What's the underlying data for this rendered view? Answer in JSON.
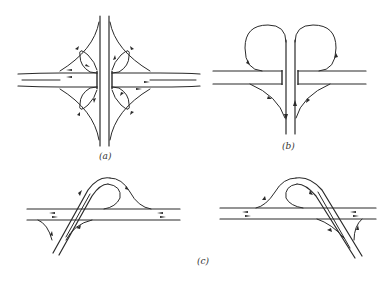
{
  "figure": {
    "panels": [
      {
        "id": "a",
        "label": "(a)",
        "description": "Full cloverleaf interchange with four loop ramps and four outer connector ramps"
      },
      {
        "id": "b",
        "label": "(b)",
        "description": "Partial interchange (T-junction) with two loop ramps and two diagonal connectors"
      },
      {
        "id": "c",
        "label": "(c)",
        "description": "Two mirrored partial cloverleaf variants with a single loop ramp and skewed crossing road"
      }
    ],
    "colors": {
      "line": "#2a2a2a",
      "background": "#ffffff",
      "label": "#333333"
    }
  }
}
